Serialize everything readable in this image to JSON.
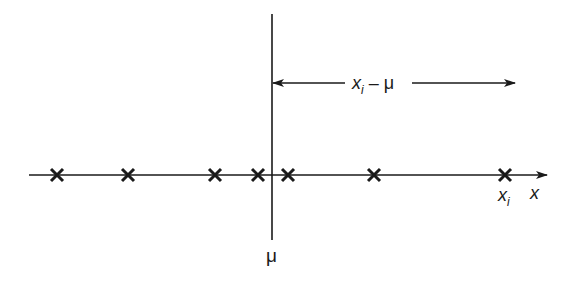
{
  "diagram": {
    "axis": {
      "label": "x",
      "y": 175,
      "x_start": 29,
      "x_end": 547
    },
    "mean_line": {
      "label": "μ",
      "x": 272,
      "y_top": 14,
      "y_bottom": 240
    },
    "points": [
      {
        "x": 57
      },
      {
        "x": 128
      },
      {
        "x": 215
      },
      {
        "x": 258
      },
      {
        "x": 288
      },
      {
        "x": 374
      },
      {
        "x": 505,
        "label": "x",
        "sub": "i"
      }
    ],
    "deviation_arrow": {
      "label_main": "x",
      "label_sub": "i",
      "label_rest": " – μ",
      "y": 83,
      "x_start": 272,
      "x_end": 515
    },
    "colors": {
      "ink": "#1a1a1a",
      "background": "#ffffff"
    }
  }
}
